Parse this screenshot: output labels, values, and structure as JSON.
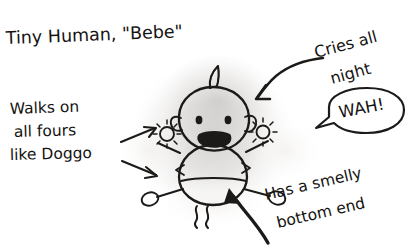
{
  "drawing": {
    "title": "Tiny Human, \"Bebe\"",
    "medium": "pencil-and-ink sketch",
    "subject": "baby diagram with labelled annotations",
    "paper_color": "#ffffff",
    "ink_color": "#1c1a19",
    "shadow_color": "#c9c6c4"
  },
  "annotations": {
    "title": {
      "text": "Tiny Human, \"Bebe\"",
      "position": "top-left"
    },
    "left_label": {
      "line1": "Walks on",
      "line2": "all fours",
      "line3": "like Doggo",
      "position": "middle-left",
      "arrows": 2,
      "points_to": "hand-and-foot"
    },
    "top_right_label": {
      "line1": "Cries all",
      "line2": "night",
      "position": "top-right",
      "arrows": 1,
      "points_to": "head"
    },
    "speech_bubble": {
      "text": "WAH!",
      "position": "right",
      "tail_direction": "left"
    },
    "bottom_right_label": {
      "line1": "Has a smelly",
      "line2": "bottom end",
      "position": "bottom-right",
      "arrows": 1,
      "points_to": "bottom"
    }
  },
  "figure": {
    "name": "baby",
    "parts": [
      "hair-tuft",
      "head",
      "left-ear",
      "right-ear",
      "left-eye",
      "right-eye",
      "open-mouth",
      "body",
      "nappy-line",
      "left-arm",
      "right-arm",
      "left-hand-starburst",
      "right-hand-starburst",
      "left-leg",
      "right-leg",
      "left-foot",
      "right-foot",
      "stink-lines"
    ]
  }
}
